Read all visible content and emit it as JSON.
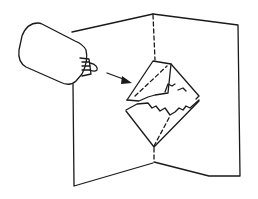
{
  "illustration": {
    "subject": "Glue bottle applying glue to a pop-up card",
    "style": "black line drawing on white",
    "colors": {
      "ink": "#1a1a1a",
      "background": "#ffffff"
    },
    "elements": [
      "glue-bottle",
      "arrow",
      "open-card",
      "center-fold",
      "diamond-pop-up"
    ]
  }
}
